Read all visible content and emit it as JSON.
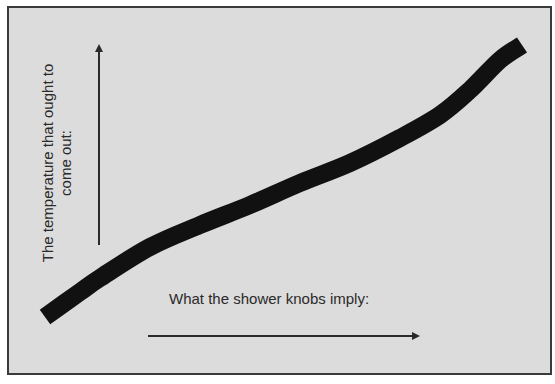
{
  "diagram": {
    "x_axis_label": "What the shower knobs imply:",
    "y_axis_label_line1": "The temperature that ought to",
    "y_axis_label_line2": "come out:",
    "colors": {
      "background": "#dcdcdc",
      "border": "#3a3a3a",
      "curve": "#111111",
      "arrow": "#2a2a2a",
      "text": "#2a2a2a"
    },
    "curve_points": [
      [
        45,
        317
      ],
      [
        80,
        292
      ],
      [
        100,
        278
      ],
      [
        150,
        247
      ],
      [
        200,
        225
      ],
      [
        250,
        205
      ],
      [
        300,
        183
      ],
      [
        350,
        163
      ],
      [
        400,
        138
      ],
      [
        440,
        115
      ],
      [
        470,
        90
      ],
      [
        500,
        60
      ],
      [
        522,
        45
      ]
    ]
  },
  "chart_data": {
    "type": "line",
    "title": "",
    "xlabel": "What the shower knobs imply:",
    "ylabel": "The temperature that ought to come out:",
    "grid": false,
    "legend": null,
    "series": [
      {
        "name": "curve",
        "x": [
          0,
          0.07,
          0.12,
          0.22,
          0.32,
          0.43,
          0.53,
          0.64,
          0.74,
          0.83,
          0.89,
          0.95,
          1.0
        ],
        "values": [
          0,
          0.09,
          0.14,
          0.26,
          0.34,
          0.41,
          0.49,
          0.56,
          0.65,
          0.74,
          0.83,
          0.94,
          1.0
        ]
      }
    ]
  }
}
